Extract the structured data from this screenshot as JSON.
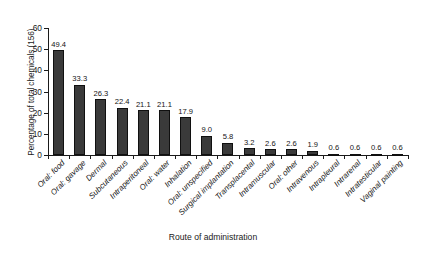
{
  "chart_data": {
    "type": "bar",
    "title": "",
    "xlabel": "Route of administration",
    "ylabel": "Percentage of total chemicals (156)",
    "ylim": [
      0,
      60
    ],
    "yticks": [
      0,
      10,
      20,
      30,
      40,
      50,
      60
    ],
    "ytick_labels": [
      "0",
      "10",
      "20",
      "30",
      "40",
      "50",
      "60"
    ],
    "grid": false,
    "legend": false,
    "bar_color": "#3a3a3a",
    "categories": [
      "Oral: food",
      "Oral: gavage",
      "Dermal",
      "Subcutaneous",
      "Intraperitoneal",
      "Oral: water",
      "Inhalation",
      "Oral: unspecified",
      "Surgical implantation",
      "Transplacental",
      "Intramuscular",
      "Oral: other",
      "Intravenous",
      "Intrapleural",
      "Intrarenal",
      "Intratesticular",
      "Vaginal painting"
    ],
    "values": [
      49.4,
      33.3,
      26.3,
      22.4,
      21.1,
      21.1,
      17.9,
      9.0,
      5.8,
      3.2,
      2.6,
      2.6,
      1.9,
      0.6,
      0.6,
      0.6,
      0.6
    ],
    "value_labels": [
      "49.4",
      "33.3",
      "26.3",
      "22.4",
      "21.1",
      "21.1",
      "17.9",
      "9.0",
      "5.8",
      "3.2",
      "2.6",
      "2.6",
      "1.9",
      "0.6",
      "0.6",
      "0.6",
      "0.6"
    ]
  }
}
